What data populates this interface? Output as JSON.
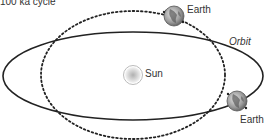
{
  "title": "100 ka cycle",
  "labels": {
    "orbit": "Orbit",
    "sun": "Sun",
    "earth_top": "Earth",
    "earth_bottom": "Earth"
  },
  "orbits": {
    "eccentric": {
      "style": "solid",
      "cx": 133,
      "cy": 76,
      "rx": 130,
      "ry": 44,
      "color": "#222222"
    },
    "circular": {
      "style": "dotted",
      "cx": 133,
      "cy": 75,
      "rx": 92,
      "ry": 64,
      "color": "#222222"
    }
  },
  "bodies": {
    "sun": {
      "cx": 133,
      "cy": 75,
      "r": 9
    },
    "earth_top": {
      "cx": 174,
      "cy": 16,
      "r": 10
    },
    "earth_bottom": {
      "cx": 237,
      "cy": 101,
      "r": 10
    }
  }
}
